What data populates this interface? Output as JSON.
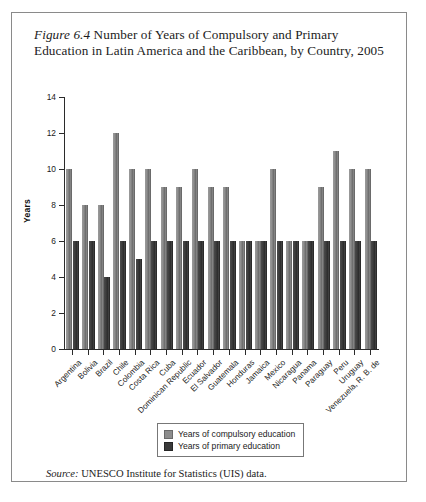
{
  "figure": {
    "number_label": "Figure 6.4",
    "title": " Number of Years of Compulsory and Primary Education in Latin America and the Caribbean, by Country, 2005",
    "source_label": "Source:",
    "source_text": " UNESCO Institute for Statistics (UIS) data."
  },
  "colors": {
    "compulsory": "#8d8d8d",
    "primary": "#3a3a3a",
    "axis": "#2b2b2b",
    "frame": "#8a8a8a",
    "text": "#1b1b1b"
  },
  "chart_data": {
    "type": "bar",
    "title": "Number of Years of Compulsory and Primary Education in Latin America and the Caribbean, by Country, 2005",
    "xlabel": "",
    "ylabel": "Years",
    "ylim": [
      0,
      14
    ],
    "yticks": [
      0,
      2,
      4,
      6,
      8,
      10,
      12,
      14
    ],
    "grid": false,
    "legend_position": "bottom-center",
    "categories": [
      "Argentina",
      "Bolivia",
      "Brazil",
      "Chile",
      "Colombia",
      "Costa Rica",
      "Cuba",
      "Dominican Republic",
      "Ecuador",
      "El Salvador",
      "Guatemala",
      "Honduras",
      "Jamaica",
      "Mexico",
      "Nicaragua",
      "Panama",
      "Paraguay",
      "Peru",
      "Uruguay",
      "Venezuela, R. B. de"
    ],
    "series": [
      {
        "name": "Years of compulsory education",
        "color": "#8d8d8d",
        "values": [
          10,
          8,
          8,
          12,
          10,
          10,
          9,
          9,
          10,
          9,
          9,
          6,
          6,
          10,
          6,
          6,
          9,
          11,
          10,
          10
        ]
      },
      {
        "name": "Years of primary education",
        "color": "#3a3a3a",
        "values": [
          6,
          6,
          4,
          6,
          5,
          6,
          6,
          6,
          6,
          6,
          6,
          6,
          6,
          6,
          6,
          6,
          6,
          6,
          6,
          6
        ]
      }
    ]
  }
}
